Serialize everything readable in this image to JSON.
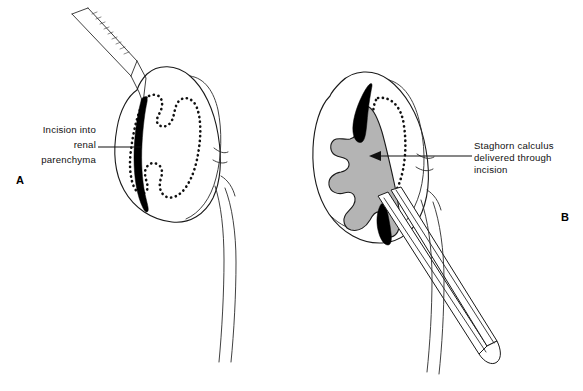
{
  "figure": {
    "background_color": "#ffffff",
    "ink_color": "#1a1a1a",
    "calculus_color": "#b4b4b4",
    "incision_color": "#000000",
    "type": "medical-surgical-illustration"
  },
  "panels": [
    {
      "id": "A",
      "letter": "A",
      "label": {
        "lines": [
          "Incision into",
          "renal",
          "parenchyma"
        ],
        "align": "right",
        "leader": "horizontal-line-no-arrow"
      },
      "elements": [
        "scalpel",
        "kidney-outline",
        "dotted-collecting-system",
        "black-parenchymal-incision",
        "ureter"
      ]
    },
    {
      "id": "B",
      "letter": "B",
      "label": {
        "lines": [
          "Staghorn calculus",
          "delivered through",
          "incision"
        ],
        "align": "left",
        "leader": "horizontal-line-with-arrowhead"
      },
      "elements": [
        "kidney-outline",
        "dotted-renal-pelvis",
        "gray-staghorn-calculus",
        "black-incision-wedges",
        "forceps",
        "ureter"
      ]
    }
  ]
}
